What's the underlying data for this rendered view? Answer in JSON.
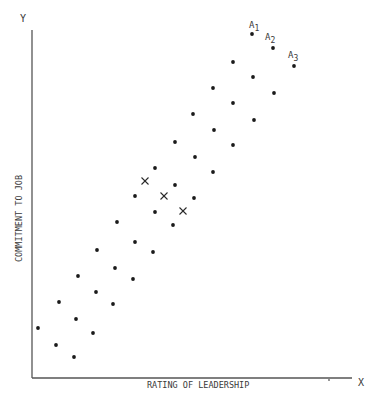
{
  "chart_data": {
    "type": "scatter",
    "title": "",
    "xlabel": "RATING OF LEADERSHIP",
    "ylabel": "COMMITMENT TO JOB",
    "x_axis_letter": "X",
    "y_axis_letter": "Y",
    "grid": false,
    "ticks": "none",
    "axis_box": {
      "origin_px": [
        32,
        378
      ],
      "x_end_px": 352,
      "y_end_px": 30
    },
    "series": [
      {
        "name": "upper band",
        "marker": "dot",
        "points_px": [
          [
            38,
            328
          ],
          [
            59,
            302
          ],
          [
            78,
            276
          ],
          [
            97,
            250
          ],
          [
            117,
            222
          ],
          [
            135,
            196
          ],
          [
            155,
            168
          ],
          [
            175,
            142
          ],
          [
            193,
            114
          ],
          [
            213,
            88
          ],
          [
            233,
            62
          ],
          [
            252,
            34
          ]
        ]
      },
      {
        "name": "middle band",
        "marker": "dot",
        "points_px": [
          [
            56,
            345
          ],
          [
            76,
            319
          ],
          [
            96,
            292
          ],
          [
            115,
            268
          ],
          [
            135,
            242
          ],
          [
            155,
            212
          ],
          [
            175,
            185
          ],
          [
            195,
            157
          ],
          [
            214,
            130
          ],
          [
            233,
            103
          ],
          [
            253,
            77
          ],
          [
            273,
            48
          ]
        ]
      },
      {
        "name": "lower band",
        "marker": "dot",
        "points_px": [
          [
            74,
            357
          ],
          [
            93,
            333
          ],
          [
            113,
            304
          ],
          [
            133,
            279
          ],
          [
            153,
            252
          ],
          [
            173,
            225
          ],
          [
            194,
            198
          ],
          [
            213,
            172
          ],
          [
            233,
            145
          ],
          [
            254,
            120
          ],
          [
            274,
            93
          ],
          [
            294,
            66
          ]
        ]
      },
      {
        "name": "crosses",
        "marker": "x",
        "points_px": [
          [
            145,
            181
          ],
          [
            164,
            196
          ],
          [
            183,
            211
          ]
        ]
      }
    ],
    "annotations": [
      {
        "text": "A",
        "sub": "1",
        "anchor_px": [
          249,
          28
        ]
      },
      {
        "text": "A",
        "sub": "2",
        "anchor_px": [
          265,
          40
        ]
      },
      {
        "text": "A",
        "sub": "3",
        "anchor_px": [
          288,
          58
        ]
      }
    ],
    "stray_mark_px": [
      329,
      380
    ]
  }
}
